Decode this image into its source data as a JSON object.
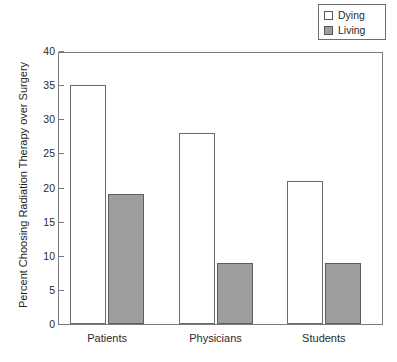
{
  "chart_data": {
    "type": "bar",
    "title": "",
    "xlabel": "",
    "ylabel": "Percent Choosing Radiation Therapy over Surgery",
    "categories": [
      "Patients",
      "Physicians",
      "Students"
    ],
    "series": [
      {
        "name": "Dying",
        "values": [
          35,
          28,
          21
        ],
        "color": "#ffffff"
      },
      {
        "name": "Living",
        "values": [
          19,
          9,
          9
        ],
        "color": "#9e9e9e"
      }
    ],
    "ylim": [
      0,
      40
    ],
    "yticks": [
      0,
      5,
      10,
      15,
      20,
      25,
      30,
      35,
      40
    ],
    "ytick_labels": [
      "0",
      "5",
      "10",
      "15",
      "20",
      "25",
      "30",
      "35",
      "40"
    ],
    "grid": false,
    "legend_position": "top-right",
    "legend_entries": [
      {
        "label": "Dying",
        "swatch": "#ffffff"
      },
      {
        "label": "Living",
        "swatch": "#9e9e9e"
      }
    ]
  },
  "axis": {
    "y_title": "Percent Choosing Radiation Therapy over Surgery"
  }
}
